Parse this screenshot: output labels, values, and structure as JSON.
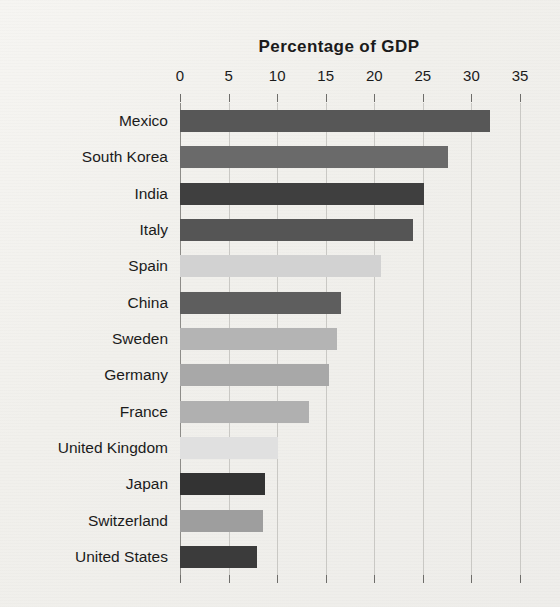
{
  "chart_data": {
    "type": "bar",
    "orientation": "horizontal",
    "title": "Percentage of GDP",
    "xlabel": "",
    "ylabel": "",
    "xlim": [
      0,
      35
    ],
    "xticks": [
      0,
      5,
      10,
      15,
      20,
      25,
      30,
      35
    ],
    "grid": true,
    "legend": "none",
    "categories": [
      "Mexico",
      "South Korea",
      "India",
      "Italy",
      "Spain",
      "China",
      "Sweden",
      "Germany",
      "France",
      "United Kingdom",
      "Japan",
      "Switzerland",
      "United States"
    ],
    "values": [
      31.9,
      27.6,
      25.1,
      24.0,
      20.7,
      16.6,
      16.2,
      15.3,
      13.3,
      10.1,
      8.8,
      8.5,
      7.9
    ],
    "bar_colors": [
      "#575757",
      "#6a6a6a",
      "#3f3f3f",
      "#555555",
      "#d2d2d2",
      "#5e5e5e",
      "#b4b4b4",
      "#a8a8a8",
      "#b0b0b0",
      "#e0e0e0",
      "#333333",
      "#9e9e9e",
      "#3b3b3b"
    ]
  },
  "style": {
    "background": "#f2f1ee",
    "gridline_color": "#c9c8c4",
    "axis_color": "#8d8c88",
    "text_color": "#1b1b1b"
  }
}
